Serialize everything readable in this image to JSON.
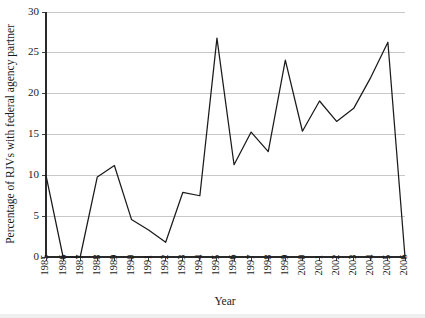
{
  "chart_data": {
    "type": "line",
    "title": "",
    "xlabel": "Year",
    "ylabel": "Percentage of RJVs with federal agency partner",
    "xlim": [
      1985,
      2006
    ],
    "ylim": [
      0,
      30
    ],
    "grid": true,
    "legend": "none",
    "categories": [
      "1985",
      "1986",
      "1987",
      "1988",
      "1989",
      "1990",
      "1991",
      "1992",
      "1993",
      "1994",
      "1995",
      "1996",
      "1997",
      "1998",
      "1999",
      "2000",
      "2001",
      "2002",
      "2003",
      "2004",
      "2005",
      "2006"
    ],
    "x": [
      1985,
      1986,
      1987,
      1988,
      1989,
      1990,
      1991,
      1992,
      1993,
      1994,
      1995,
      1996,
      1997,
      1998,
      1999,
      2000,
      2001,
      2002,
      2003,
      2004,
      2005,
      2006
    ],
    "values": [
      10.0,
      0.0,
      0.0,
      9.8,
      11.2,
      4.6,
      3.3,
      1.8,
      7.9,
      7.5,
      26.8,
      11.3,
      15.3,
      12.9,
      24.1,
      15.4,
      19.1,
      16.6,
      18.2,
      22.0,
      26.3,
      0.0
    ],
    "series": [
      {
        "name": "Percentage of RJVs with federal agency partner",
        "values": [
          10.0,
          0.0,
          0.0,
          9.8,
          11.2,
          4.6,
          3.3,
          1.8,
          7.9,
          7.5,
          26.8,
          11.3,
          15.3,
          12.9,
          24.1,
          15.4,
          19.1,
          16.6,
          18.2,
          22.0,
          26.3,
          0.0
        ],
        "color": "#1a1a1a"
      }
    ],
    "ytick_labels": [
      "0",
      "5",
      "10",
      "15",
      "20",
      "25",
      "30"
    ],
    "ytick_values": [
      0,
      5,
      10,
      15,
      20,
      25,
      30
    ],
    "colors": {
      "line": "#1a1a1a",
      "grid": "#b9b9b9",
      "axis": "#2a2a2a",
      "background": "#ffffff"
    }
  }
}
